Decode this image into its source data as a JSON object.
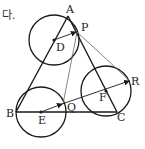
{
  "header_text": "다.",
  "points": {
    "A": {
      "label": "A",
      "x": 68,
      "y": 16
    },
    "B": {
      "label": "B",
      "x": 16,
      "y": 112
    },
    "C": {
      "label": "C",
      "x": 117,
      "y": 112
    },
    "D": {
      "label": "D",
      "x": 54,
      "y": 40
    },
    "E": {
      "label": "E",
      "x": 41,
      "y": 112
    },
    "F": {
      "label": "F",
      "x": 106,
      "y": 91
    },
    "P": {
      "label": "P",
      "x": 77,
      "y": 32
    },
    "Q": {
      "label": "Q",
      "x": 63,
      "y": 104
    },
    "R": {
      "label": "R",
      "x": 130,
      "y": 81
    }
  },
  "circles": [
    {
      "center": "D",
      "radius": 25
    },
    {
      "center": "E",
      "radius": 25
    },
    {
      "center": "F",
      "radius": 25
    }
  ],
  "triangle": [
    "A",
    "B",
    "C"
  ],
  "vectors": [
    {
      "from": "D",
      "to": "P"
    },
    {
      "from": "E",
      "to": "Q"
    },
    {
      "from": "Q",
      "to": "R"
    }
  ],
  "thin_lines": [
    {
      "from": "P",
      "to": "Q"
    },
    {
      "from": "P",
      "to": "R"
    }
  ],
  "colors": {
    "stroke": "#1a1a1a",
    "thin_stroke": "#666666",
    "background": "#ffffff"
  }
}
